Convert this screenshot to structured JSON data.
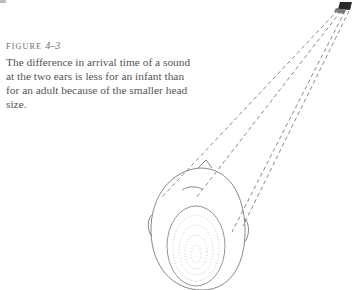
{
  "figure": {
    "label_prefix": "FIGURE",
    "label_number": "4–3",
    "caption": "The difference in arrival time of a sound at the two ears is less for an infant than for an adult because of the smaller head size."
  },
  "illustration": {
    "subject": "top view of infant head with dashed sound paths from a source to both ears",
    "source_icon": "sound-source-icon",
    "line_color": "#8a8a8a",
    "line_count": 4
  }
}
